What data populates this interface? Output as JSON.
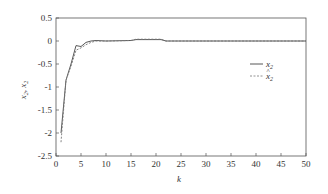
{
  "chart_data": {
    "type": "line",
    "title": "",
    "xlabel": "k",
    "ylabel": "x2, x̂2",
    "xlim": [
      0,
      50
    ],
    "ylim": [
      -2.5,
      0.5
    ],
    "xticks": [
      0,
      5,
      10,
      15,
      20,
      25,
      30,
      35,
      40,
      45,
      50
    ],
    "yticks": [
      0.5,
      0,
      -0.5,
      -1,
      -1.5,
      -2,
      -2.5
    ],
    "ytick_labels": [
      "0.5",
      "0",
      "-0.5",
      "-1",
      "-1.5",
      "-2",
      "-2.5"
    ],
    "grid": false,
    "legend_position": "upper right",
    "series": [
      {
        "name": "x2",
        "style": "solid",
        "x": [
          1,
          2,
          3,
          4,
          5,
          6,
          7,
          8,
          10,
          15,
          16,
          21,
          22,
          25,
          30,
          40,
          50
        ],
        "y": [
          -2.0,
          -0.85,
          -0.5,
          -0.1,
          -0.12,
          -0.03,
          0.0,
          0.01,
          0.0,
          0.01,
          0.03,
          0.03,
          0.0,
          0.0,
          0.0,
          0.0,
          0.0
        ]
      },
      {
        "name": "x̂2",
        "style": "dashed",
        "x": [
          1,
          2,
          3,
          4,
          5,
          6,
          7,
          8,
          10,
          15,
          16,
          21,
          22,
          25,
          30,
          40,
          50
        ],
        "y": [
          -2.2,
          -0.85,
          -0.55,
          -0.2,
          -0.15,
          -0.08,
          -0.03,
          0.0,
          0.0,
          0.01,
          0.04,
          0.04,
          0.0,
          0.0,
          0.0,
          0.0,
          0.0
        ]
      }
    ]
  },
  "legend": {
    "items": [
      {
        "label": "x",
        "sub": "2",
        "hat": false
      },
      {
        "label": "x",
        "sub": "2",
        "hat": true
      }
    ]
  },
  "axes": {
    "xlabel": "k",
    "ylabel_a": "x",
    "ylabel_sub": "2",
    "ylabel_sep": ", "
  }
}
